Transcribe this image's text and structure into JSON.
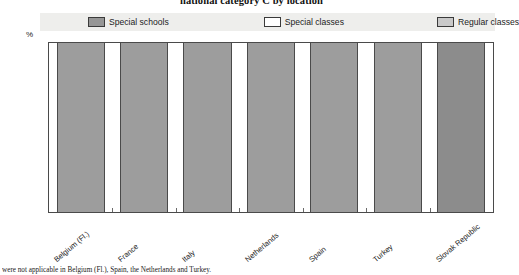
{
  "chart_data": {
    "type": "bar",
    "title": "national category C by location",
    "subtitle": "",
    "xlabel": "",
    "ylabel": "%",
    "ylim": [
      0,
      100
    ],
    "yticks": [
      0,
      10,
      20,
      30,
      40,
      50,
      60,
      70,
      80,
      90,
      100
    ],
    "grid": false,
    "legend_position": "top",
    "stacked": true,
    "categories": [
      "Belgium (Fl.)",
      "France",
      "Italy",
      "Netherlands",
      "Spain",
      "Turkey",
      "Slovak Republic"
    ],
    "series": [
      {
        "name": "Special schools",
        "color": "#9d9d9d",
        "values": [
          100,
          100,
          100,
          100,
          100,
          100,
          100
        ]
      },
      {
        "name": "Special classes",
        "color": "#ffffff",
        "values": [
          0,
          0,
          0,
          0,
          0,
          0,
          0
        ]
      },
      {
        "name": "Regular classes",
        "color": "#c9c9c9",
        "values": [
          0,
          0,
          0,
          0,
          0,
          0,
          0
        ]
      }
    ],
    "annotations": []
  },
  "header": {
    "title": "national category C by location"
  },
  "axis": {
    "unit": "%",
    "ticks": [
      "100",
      "90",
      "80",
      "70",
      "60",
      "50",
      "40",
      "30",
      "20",
      "10",
      "0"
    ]
  },
  "legend": {
    "items": [
      {
        "label": "Special schools",
        "swatch": "legend-swatch-special-schools",
        "color": "#969696"
      },
      {
        "label": "Special classes",
        "swatch": "legend-swatch-special-classes",
        "color": "#ffffff"
      },
      {
        "label": "Regular classes",
        "swatch": "legend-swatch-regular-classes",
        "color": "#c9c9c9"
      }
    ]
  },
  "footnote": {
    "text": "were not applicable in Belgium (Fl.), Spain, the Netherlands and Turkey."
  }
}
